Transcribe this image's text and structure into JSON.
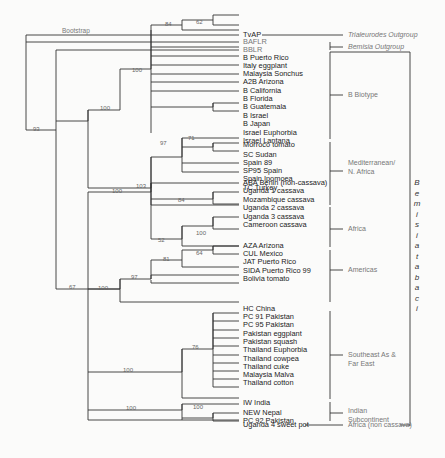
{
  "figure": {
    "bootstrap_label": "Bootstrap",
    "species_label": "Bemisia tabaci",
    "tips": [
      "TvAP",
      "BAFLR",
      "BBLR",
      "B Puerto Rico",
      "Italy eggplant",
      "Malaysia Sonchus",
      "A2B Arizona",
      "B California",
      "B Florida",
      "B Guatemala",
      "B Israel",
      "B Japan",
      "Israel Euphorbia",
      "Israel Lantana",
      "Morroco tomato",
      "SC Sudan",
      "Spain 89",
      "SP95 Spain",
      "Spain Ipomoea",
      "TC Turkey",
      "ABA Benin (non-cassava)",
      "Uganda 1 cassava",
      "Mozambique cassava",
      "Uganda 2 cassava",
      "Uganda 3 cassava",
      "Cameroon cassava",
      "AZA Arizona",
      "CUL Mexico",
      "JAT Puerto Rico",
      "SIDA Puerto Rico 99",
      "Bolivia tomato",
      "HC China",
      "PC 91 Pakistan",
      "PC 95 Pakistan",
      "Pakistan eggplant",
      "Pakistan squash",
      "Thailand Euphorbia",
      "Thailand cowpea",
      "Thailand cuke",
      "Malaysia Malva",
      "Thailand cotton",
      "IW India",
      "NEW Nepal",
      "PC 92 Pakistan",
      "Uganda 4 sweet pot"
    ],
    "groups": [
      {
        "label": "Trialeurodes Outgroup",
        "italic": true
      },
      {
        "label": "Bemisia Outgroup",
        "italic": true
      },
      {
        "label": "B Biotype",
        "italic": false
      },
      {
        "label": "Mediterranean/\nN. Africa",
        "italic": false
      },
      {
        "label": "Africa",
        "italic": false
      },
      {
        "label": "Americas",
        "italic": false
      },
      {
        "label": "Southeast As &\nFar East",
        "italic": false
      },
      {
        "label": "Indian\nSubcontinent",
        "italic": false
      },
      {
        "label": "Africa (non cassava)",
        "italic": false
      }
    ],
    "bootstrap_values": [
      "62",
      "84",
      "100",
      "93",
      "100",
      "71",
      "97",
      "103",
      "100",
      "84",
      "100",
      "52",
      "67",
      "64",
      "81",
      "97",
      "100",
      "76",
      "100",
      "100",
      "100"
    ]
  }
}
